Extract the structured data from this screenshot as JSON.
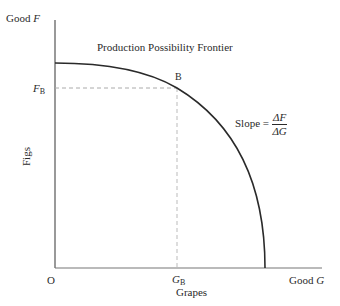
{
  "title": "Production Possibility Frontier",
  "axes": {
    "y_label_top": "Good",
    "y_label_top_var": "F",
    "y_name": "Figs",
    "x_label_right": "Good",
    "x_label_right_var": "G",
    "x_name": "Grapes",
    "origin": "O"
  },
  "point": {
    "name": "B",
    "f_label": "F",
    "f_sub": "B",
    "g_label": "G",
    "g_sub": "B"
  },
  "slope": {
    "label": "Slope =",
    "numerator": "ΔF",
    "denominator": "ΔG"
  },
  "colors": {
    "curve": "#2a2a2a",
    "axis": "#555555",
    "dashed": "#aaaaaa"
  }
}
